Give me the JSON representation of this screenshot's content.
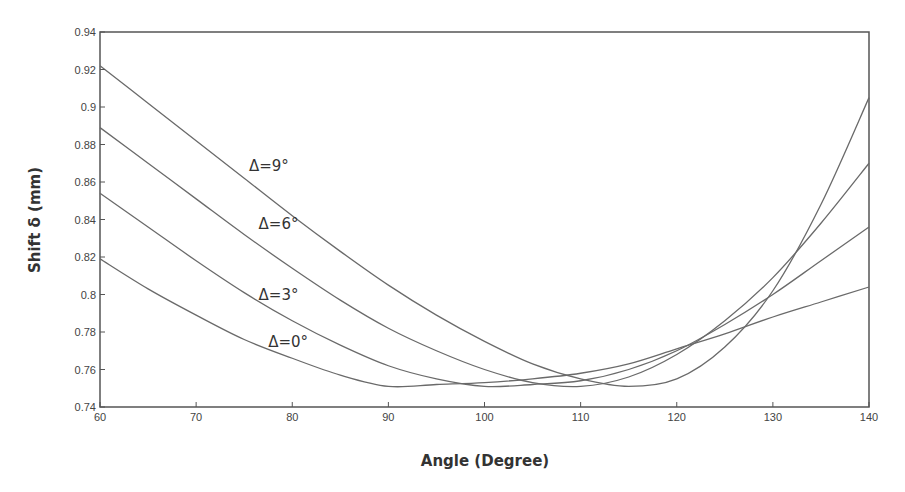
{
  "chart_data": {
    "type": "line",
    "title": "",
    "xlabel": "Angle (Degree)",
    "ylabel": "Shift δ (mm)",
    "xlim": [
      60,
      140
    ],
    "ylim": [
      0.74,
      0.94
    ],
    "grid": false,
    "legend": "inline labels on curves",
    "x_ticks": [
      "60",
      "70",
      "80",
      "90",
      "100",
      "110",
      "120",
      "130",
      "140"
    ],
    "y_ticks": [
      "0.74",
      "0.76",
      "0.78",
      "0.8",
      "0.82",
      "0.84",
      "0.86",
      "0.88",
      "0.9",
      "0.92",
      "0.94"
    ],
    "x": [
      60,
      65,
      70,
      75,
      80,
      85,
      90,
      95,
      100,
      105,
      110,
      115,
      120,
      125,
      130,
      135,
      140
    ],
    "series": [
      {
        "name": "Δ=0°",
        "label": "Δ=0°",
        "values": [
          0.819,
          0.803,
          0.789,
          0.776,
          0.766,
          0.757,
          0.751,
          0.752,
          0.753,
          0.755,
          0.758,
          0.763,
          0.771,
          0.779,
          0.788,
          0.796,
          0.804
        ]
      },
      {
        "name": "Δ=3°",
        "label": "Δ=3°",
        "values": [
          0.854,
          0.836,
          0.818,
          0.801,
          0.786,
          0.773,
          0.762,
          0.755,
          0.751,
          0.752,
          0.754,
          0.76,
          0.77,
          0.784,
          0.8,
          0.818,
          0.836
        ]
      },
      {
        "name": "Δ=6°",
        "label": "Δ=6°",
        "values": [
          0.889,
          0.87,
          0.851,
          0.832,
          0.814,
          0.797,
          0.782,
          0.77,
          0.76,
          0.753,
          0.751,
          0.756,
          0.768,
          0.786,
          0.809,
          0.838,
          0.87
        ]
      },
      {
        "name": "Δ=9°",
        "label": "Δ=9°",
        "values": [
          0.922,
          0.902,
          0.882,
          0.862,
          0.842,
          0.823,
          0.805,
          0.789,
          0.775,
          0.763,
          0.755,
          0.751,
          0.755,
          0.772,
          0.802,
          0.848,
          0.905
        ]
      }
    ],
    "annotations": [
      {
        "text": "Δ=9°",
        "x": 75.5,
        "y": 0.866
      },
      {
        "text": "Δ=6°",
        "x": 76.5,
        "y": 0.835
      },
      {
        "text": "Δ=3°",
        "x": 76.5,
        "y": 0.797
      },
      {
        "text": "Δ=0°",
        "x": 77.5,
        "y": 0.772
      }
    ]
  },
  "colors": {
    "line": "#6a6a6a",
    "axis": "#555555",
    "text": "#333333",
    "background": "#ffffff"
  }
}
